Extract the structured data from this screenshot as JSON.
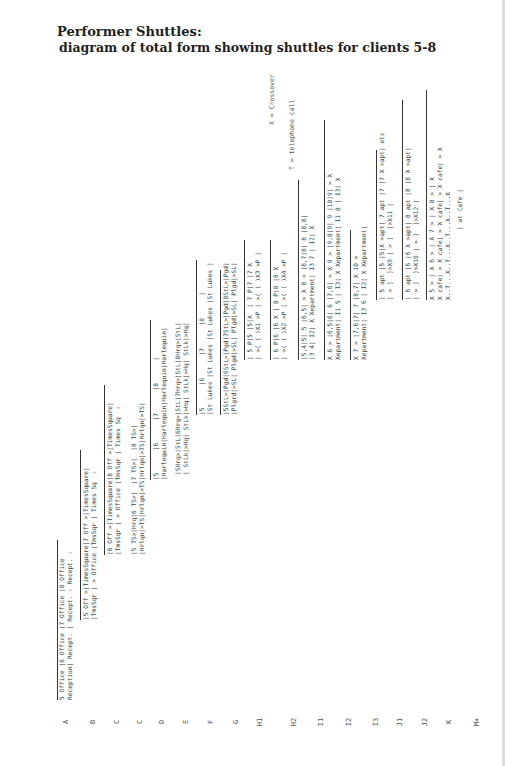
{
  "title": {
    "line1": "Performer Shuttles:",
    "line2": "diagram of total form showing shuttles for clients 5-8"
  },
  "legend": {
    "crossover": "X = Crossover",
    "telephone": "T = telephone call"
  },
  "row_labels": [
    "A",
    "B",
    "C",
    "C",
    "D",
    "E",
    "F",
    "G",
    "H1",
    "H2",
    "I1",
    "I2",
    "I3",
    "J1",
    "J2",
    "K",
    "M+"
  ],
  "rows": [
    {
      "id": "A",
      "lines": [
        "5 Office |6 Office |7 Office |8 Office",
        "Reception| Recept. | Recept. : Recept. :"
      ]
    },
    {
      "id": "B",
      "lines": [
        "|5 Off >|TimesSquare|7 Off >|TimesSquare|",
        "|TmsSqr | > Office |TmsSqr | Times Sq  :"
      ]
    },
    {
      "id": "C1",
      "lines": [
        "|6 Off >|TimesSquare|8 Off >|TimesSquare|",
        "|TmsSqr | > Office |TmsSqr | Times Sq  :"
      ]
    },
    {
      "id": "C2",
      "lines": [
        "|5 TS>|Hrq|6 TS>|  |7 TS>|  |8 TS>|",
        "|Hrlqn|>TS|Hrlqn|>TS|Hrlqn|>TS|Hrlqn|>TS|"
      ]
    },
    {
      "id": "D",
      "lines": [
        "|5      |6      |7      |8      |",
        "|Harlequin|Harlequin|Harlequin|Harlequin|"
      ]
    },
    {
      "id": "E",
      "lines": [
        "|SHrq>|StL|6Hrq>|StL|7Hrq>|StL|8Hrq>|StL|",
        "| StLk|>Hq| StLk|>Hq| StLk|>Hq| StLk|>Hq|"
      ]
    },
    {
      "id": "F",
      "lines": [
        "|5      |6      |7      |8      |",
        "|St Lukes |St Lukes |St Lukes |St Lukes |"
      ]
    },
    {
      "id": "G",
      "lines": [
        "|5StL>|Pgd|6StL>|Pgd|7StL>|Pgd|8StL>|Pgd|",
        "|Plgrd|>SL| Plgd|>SL| Plgd|>SL| Plgd|>SL|"
      ]
    },
    {
      "id": "H1",
      "lines": [
        "| 5 P|5 |5|X  | 7 P|7 |7 X",
        "| >( ( )X1 >P | >( ( )X3 >P |"
      ]
    },
    {
      "id": "H2",
      "lines": [
        "| 6 P|6 |6 X | 8 P|8 |8 X",
        "| >( ( )X2 >P | >( ( )X4 >P |"
      ]
    },
    {
      "id": "I1",
      "lines": [
        "|5,4|5| 5 |6,5| > X 8 > |8,7|8| 8 |8,8|",
        "|3 4| I2| X Xepartment| I3 7 | I2| X"
      ]
    },
    {
      "id": "I2",
      "lines": [
        "X 6 > |6,5|6| 6 |7,6| > X 9 > |9,8|9| 9 |10|9| > X",
        "Xepartment| I1 5 | I3| X Xepartment| I1 8 | I3| X"
      ]
    },
    {
      "id": "I3",
      "lines": [
        "X 7 > |7,6|7| 7 |8,7| X 10 >",
        "Xepartment| I3 6 | I2| X Xepartment|"
      ]
    },
    {
      "id": "J1",
      "lines": [
        "| 5 apt |5 |5|X >apt| 7 apt |7 |7 X >apt| etc",
        "| > ]  ]>X9 | > ]  ]>X11 |"
      ]
    },
    {
      "id": "J2",
      "lines": [
        "| 6 apt |6 |6 X >apt| 8 apt |8 |8 X >apt|",
        "| > ]  ]>X10 | > ]  ]>X12 |"
      ]
    },
    {
      "id": "K",
      "lines": [
        "X 5 > | X 6 > | X 7 > | X 8 > | X",
        "X cafe| > X cafe| > X cafe| > X cafe| > X",
        "X..T...X..T...X..T...X..T...X"
      ]
    },
    {
      "id": "M+",
      "lines": [
        "| at Cafe |"
      ]
    }
  ]
}
